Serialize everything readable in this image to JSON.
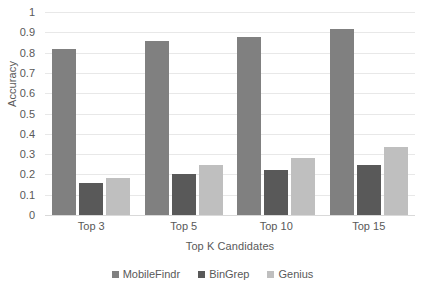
{
  "chart_data": {
    "type": "bar",
    "title": "",
    "xlabel": "Top K Candidates",
    "ylabel": "Accuracy",
    "categories": [
      "Top 3",
      "Top 5",
      "Top 10",
      "Top 15"
    ],
    "series": [
      {
        "name": "MobileFindr",
        "color": "#808080",
        "values": [
          0.82,
          0.855,
          0.875,
          0.915
        ]
      },
      {
        "name": "BinGrep",
        "color": "#595959",
        "values": [
          0.16,
          0.2,
          0.22,
          0.245
        ]
      },
      {
        "name": "Genius",
        "color": "#bfbfbf",
        "values": [
          0.18,
          0.245,
          0.28,
          0.335
        ]
      }
    ],
    "ylim": [
      0,
      1
    ],
    "ytick_values": [
      0,
      0.1,
      0.2,
      0.3,
      0.4,
      0.5,
      0.6,
      0.7,
      0.8,
      0.9,
      1
    ],
    "ytick_labels": [
      "0",
      "0.1",
      "0.2",
      "0.3",
      "0.4",
      "0.5",
      "0.6",
      "0.7",
      "0.8",
      "0.9",
      "1"
    ],
    "grid": "horizontal",
    "legend_position": "bottom",
    "grid_color": "#e8e8e8",
    "text_color": "#595959",
    "background": "#ffffff"
  }
}
